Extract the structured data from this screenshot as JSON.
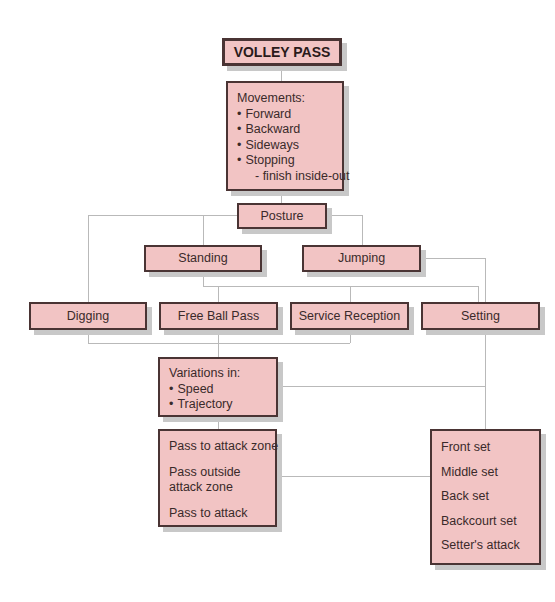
{
  "title": "VOLLEY PASS",
  "movements": {
    "heading": "Movements:",
    "items": [
      "Forward",
      "Backward",
      "Sideways",
      "Stopping"
    ],
    "sub_item": "- finish inside-out"
  },
  "posture": "Posture",
  "posture_types": {
    "standing": "Standing",
    "jumping": "Jumping"
  },
  "pass_types": {
    "digging": "Digging",
    "free_ball_pass": "Free Ball Pass",
    "service_reception": "Service Reception",
    "setting": "Setting"
  },
  "variations": {
    "heading": "Variations in:",
    "items": [
      "Speed",
      "Trajectory"
    ]
  },
  "pass_targets": [
    "Pass to attack zone",
    "Pass outside attack zone",
    "Pass to attack"
  ],
  "set_types": [
    "Front set",
    "Middle set",
    "Back set",
    "Backcourt set",
    "Setter's attack"
  ],
  "colors": {
    "box_fill": "#f2c4c4",
    "box_border": "#4a3434",
    "connector": "#b9b9b9",
    "shadow": "#c8c8c8"
  }
}
